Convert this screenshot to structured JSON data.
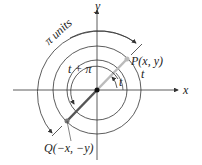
{
  "diagram": {
    "axes": {
      "x_label": "x",
      "y_label": "y"
    },
    "points": {
      "P": "P(x, y)",
      "Q": "Q(−x, −y)"
    },
    "angles": {
      "t": "t",
      "t_plus_pi": "t + π",
      "arc_t": "t"
    },
    "arc_label": "π units",
    "colors": {
      "line": "#333333",
      "segment_op": "#bbbbbb",
      "segment_oq": "#555555"
    }
  }
}
